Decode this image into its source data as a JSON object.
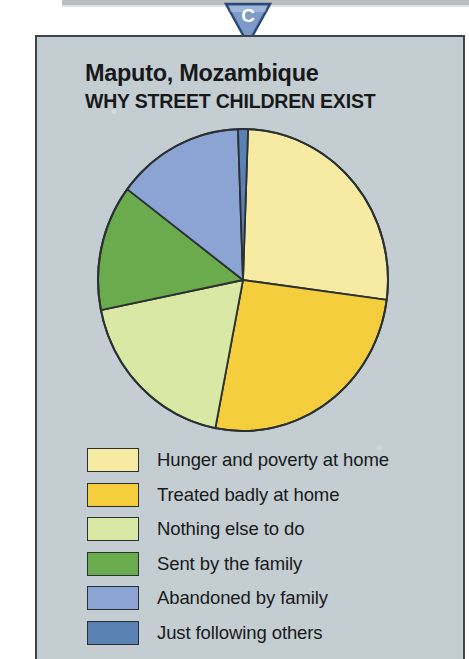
{
  "credit": "Mozambique Ministry of Health",
  "marker": {
    "letter": "C",
    "fill_color": "#7d9ac8",
    "edge_color": "#2b4a78"
  },
  "panel": {
    "background_color": "#c4ced2",
    "border_color": "#3d4548"
  },
  "chart_data": {
    "type": "pie",
    "title": "Maputo, Mozambique",
    "subtitle": "WHY STREET CHILDREN EXIST",
    "xlabel": "",
    "ylabel": "",
    "legend_position": "bottom",
    "grid": false,
    "start_angle_deg": 2,
    "categories": [
      "Hunger and poverty at home",
      "Treated badly at home",
      "Nothing else to do",
      "Sent by the family",
      "Abandoned by family",
      "Just following others"
    ],
    "values": [
      26,
      26,
      19,
      14,
      13,
      2
    ],
    "colors": [
      "#f7eba4",
      "#f5ce3e",
      "#d9e8a4",
      "#6aab4e",
      "#8ba4d4",
      "#5981b2"
    ],
    "slice_edge_color": "#2b3133",
    "slices": [
      {
        "label": "Hunger and poverty at home",
        "value": 26,
        "color": "#f7eba4",
        "start_deg": 2,
        "end_deg": 97.6
      },
      {
        "label": "Treated badly at home",
        "value": 26,
        "color": "#f5ce3e",
        "start_deg": 97.6,
        "end_deg": 191
      },
      {
        "label": "Nothing else to do",
        "value": 19,
        "color": "#d9e8a4",
        "start_deg": 191,
        "end_deg": 258.5
      },
      {
        "label": "Sent by the family",
        "value": 14,
        "color": "#6aab4e",
        "start_deg": 258.5,
        "end_deg": 307
      },
      {
        "label": "Abandoned by family",
        "value": 13,
        "color": "#8ba4d4",
        "start_deg": 307,
        "end_deg": 358
      },
      {
        "label": "Just following others",
        "value": 2,
        "color": "#5981b2",
        "start_deg": 358,
        "end_deg": 362
      }
    ]
  },
  "legend": [
    {
      "label": "Hunger and poverty at home",
      "color": "#f7eba4"
    },
    {
      "label": "Treated badly at home",
      "color": "#f5ce3e"
    },
    {
      "label": "Nothing else to do",
      "color": "#d9e8a4"
    },
    {
      "label": "Sent by the family",
      "color": "#6aab4e"
    },
    {
      "label": "Abandoned by family",
      "color": "#8ba4d4"
    },
    {
      "label": "Just following others",
      "color": "#5981b2"
    }
  ]
}
